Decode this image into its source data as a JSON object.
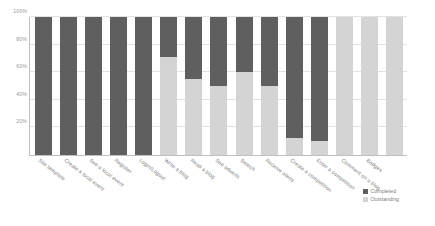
{
  "chart_data": {
    "type": "bar",
    "stacked": true,
    "title": "",
    "xlabel": "",
    "ylabel": "",
    "ylim": [
      0,
      100
    ],
    "yticks": [
      "20%",
      "40%",
      "60%",
      "80%",
      "100%"
    ],
    "ytick_values": [
      20,
      40,
      60,
      80,
      100
    ],
    "grid": true,
    "legend_position": "bottom-right",
    "categories": [
      "Site template",
      "Create a local event",
      "See a local event",
      "Register",
      "Login/Logout",
      "Write a blog",
      "Read a blog",
      "See adverts",
      "Search",
      "Receive alerts",
      "Create a competition",
      "Enter a competition",
      "Comment on a blog",
      "Badges",
      ""
    ],
    "series": [
      {
        "name": "Completed",
        "color": "#5f5f5f",
        "values": [
          100,
          100,
          100,
          100,
          100,
          29,
          45,
          50,
          40,
          50,
          88,
          90,
          0,
          0,
          0
        ]
      },
      {
        "name": "Outstanding",
        "color": "#d4d4d4",
        "values": [
          0,
          0,
          0,
          0,
          0,
          71,
          55,
          50,
          60,
          50,
          12,
          10,
          100,
          100,
          100
        ]
      }
    ]
  },
  "legend": {
    "items": [
      {
        "label": "Completed",
        "color": "#5f5f5f"
      },
      {
        "label": "Outstanding",
        "color": "#d4d4d4"
      }
    ]
  },
  "colors": {
    "completed": "#5f5f5f",
    "outstanding": "#d4d4d4",
    "axis": "#bfbfbf",
    "grid": "#e2e2e2",
    "text": "#7d7d7d",
    "background": "#ffffff"
  }
}
